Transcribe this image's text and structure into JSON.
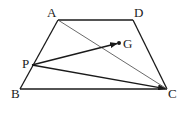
{
  "figure": {
    "labels": {
      "A": "A",
      "B": "B",
      "C": "C",
      "D": "D",
      "P": "P",
      "G": "G"
    },
    "segments": [
      "AD",
      "DC",
      "BC",
      "AB",
      "AC"
    ],
    "vectors": [
      "PG",
      "PC"
    ],
    "points": [
      "G"
    ],
    "colors": {
      "stroke": "#1a1a1a",
      "diagonal": "#444444",
      "background": "#ffffff"
    }
  }
}
